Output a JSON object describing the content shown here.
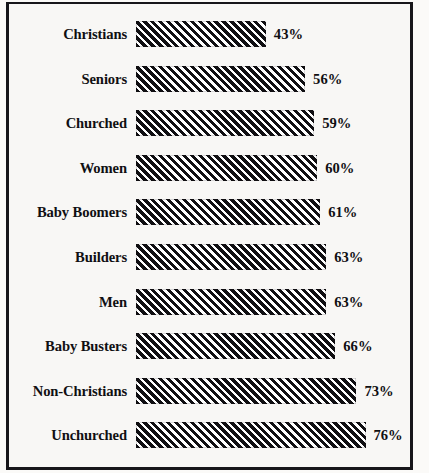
{
  "chart_data": {
    "type": "bar",
    "orientation": "horizontal",
    "title": "",
    "subtitle": "",
    "xlabel": "",
    "ylabel": "",
    "grid": false,
    "legend": null,
    "xlim": [
      0,
      76
    ],
    "value_suffix": "%",
    "categories": [
      "Christians",
      "Seniors",
      "Churched",
      "Women",
      "Baby Boomers",
      "Builders",
      "Men",
      "Baby Busters",
      "Non-Christians",
      "Unchurched"
    ],
    "values": [
      43,
      56,
      59,
      60,
      61,
      63,
      63,
      66,
      73,
      76
    ],
    "value_labels": [
      "43%",
      "56%",
      "59%",
      "60%",
      "61%",
      "63%",
      "63%",
      "66%",
      "73%",
      "76%"
    ],
    "colors": {
      "bar_fill": "#ffffff",
      "bar_hatch": "#100f12",
      "text": "#100f12",
      "background": "#f8f7f5",
      "frame": "#17161a"
    },
    "bars": [
      {
        "label": "Christians",
        "value": 43,
        "value_label": "43%"
      },
      {
        "label": "Seniors",
        "value": 56,
        "value_label": "56%"
      },
      {
        "label": "Churched",
        "value": 59,
        "value_label": "59%"
      },
      {
        "label": "Women",
        "value": 60,
        "value_label": "60%"
      },
      {
        "label": "Baby Boomers",
        "value": 61,
        "value_label": "61%"
      },
      {
        "label": "Builders",
        "value": 63,
        "value_label": "63%"
      },
      {
        "label": "Men",
        "value": 63,
        "value_label": "63%"
      },
      {
        "label": "Baby Busters",
        "value": 66,
        "value_label": "66%"
      },
      {
        "label": "Non-Christians",
        "value": 73,
        "value_label": "73%"
      },
      {
        "label": "Unchurched",
        "value": 76,
        "value_label": "76%"
      }
    ]
  },
  "layout": {
    "row_pitch": 44.6,
    "first_row_top": 12,
    "bar_origin_x": 127,
    "px_per_unit": 3.02,
    "value_gap": 8
  }
}
